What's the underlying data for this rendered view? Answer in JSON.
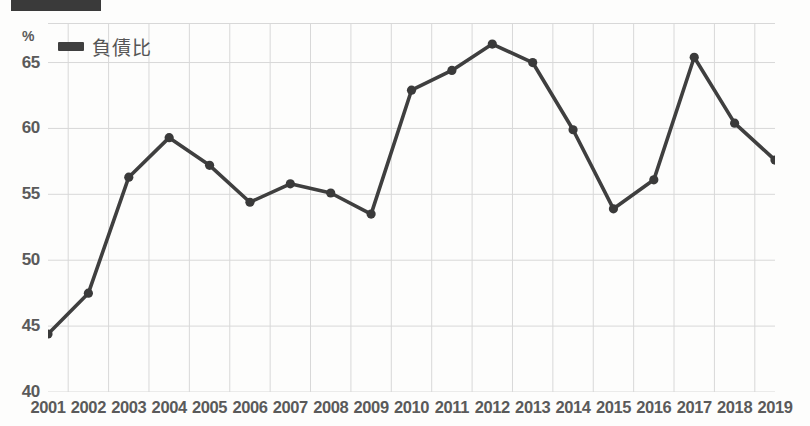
{
  "title_bar": {
    "label": ""
  },
  "legend": {
    "position": "top-left-inside",
    "entries": [
      {
        "label": "負債比",
        "color": "#3f3f3f",
        "marker": "legend-swatch"
      }
    ]
  },
  "axes": {
    "y_unit": "%",
    "y_ticks": [
      "40",
      "45",
      "50",
      "55",
      "60",
      "65"
    ],
    "x_ticks": [
      "2001",
      "2002",
      "2003",
      "2004",
      "2005",
      "2006",
      "2007",
      "2008",
      "2009",
      "2010",
      "2011",
      "2012",
      "2013",
      "2014",
      "2015",
      "2016",
      "2017",
      "2018",
      "2019"
    ]
  },
  "colors": {
    "line": "#3f3f3f",
    "marker": "#3a3a3a",
    "grid": "#d8d8d8",
    "axis_text": "#5a5a5a",
    "background": "#fdfdfc"
  },
  "chart_data": {
    "type": "line",
    "title": "",
    "subtitle": "",
    "xlabel": "",
    "ylabel": "%",
    "ylim": [
      40,
      65
    ],
    "y_axis_max_plotted": 68.0,
    "ytick_values": [
      40,
      45,
      50,
      55,
      60,
      65
    ],
    "grid": true,
    "legend_position": "top-left",
    "categories": [
      "2001",
      "2002",
      "2003",
      "2004",
      "2005",
      "2006",
      "2007",
      "2008",
      "2009",
      "2010",
      "2011",
      "2012",
      "2013",
      "2014",
      "2015",
      "2016",
      "2017",
      "2018",
      "2019"
    ],
    "series": [
      {
        "name": "負債比",
        "color": "#3f3f3f",
        "values": [
          44.4,
          47.5,
          56.3,
          59.3,
          57.2,
          54.4,
          55.8,
          55.1,
          53.5,
          62.9,
          64.4,
          66.4,
          65.0,
          59.9,
          53.9,
          56.1,
          65.4,
          60.4,
          57.6
        ]
      }
    ],
    "annotations": []
  }
}
